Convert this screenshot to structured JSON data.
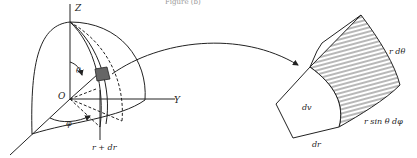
{
  "caption": "Figure (b)",
  "left_figure": {
    "axes": {
      "z": "Z",
      "y": "Y",
      "origin": "O"
    },
    "labels": {
      "theta": "θ",
      "phi": "φ",
      "r_dr": "r + dr"
    }
  },
  "right_figure": {
    "labels": {
      "volume": "dv",
      "radial": "dr",
      "polar_arc": "r dθ",
      "azimuthal_arc": "r sin θ dφ"
    }
  },
  "colors": {
    "stroke": "#222222",
    "background": "#ffffff"
  }
}
